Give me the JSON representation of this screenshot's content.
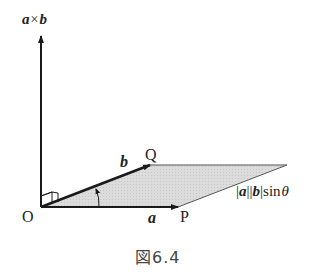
{
  "diagram": {
    "axis_label": {
      "a": "a",
      "times": "×",
      "b": "b"
    },
    "points": {
      "origin": "O",
      "P": "P",
      "Q": "Q"
    },
    "vectors": {
      "a_label": "a",
      "b_label": "b"
    },
    "area_label": {
      "bar1": "|",
      "a": "a",
      "bar2": "||",
      "b": "b",
      "bar3": "|",
      "sin": "sin",
      "theta": "θ"
    },
    "caption": "図6.4",
    "colors": {
      "line": "#1a1a1a",
      "fill": "#d9d9d9",
      "text": "#222222",
      "caption": "#444444"
    }
  }
}
